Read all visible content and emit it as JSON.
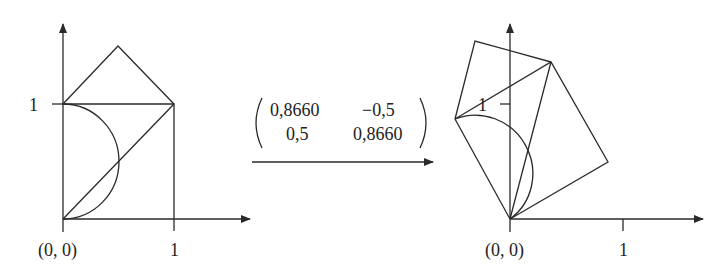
{
  "left_figure": {
    "origin_label": "(0, 0)",
    "x_tick_label": "1",
    "y_tick_label": "1"
  },
  "transformation": {
    "matrix": [
      [
        "0,8660",
        "−0,5"
      ],
      [
        "0,5",
        "0,8660"
      ]
    ],
    "arrow": "right-arrow"
  },
  "right_figure": {
    "origin_label": "(0, 0)",
    "x_tick_label": "1",
    "y_tick_label": "1"
  },
  "colors": {
    "stroke": "#2a2a2a",
    "background": "#ffffff"
  }
}
